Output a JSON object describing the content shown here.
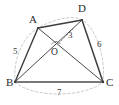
{
  "figure": {
    "width": 119,
    "height": 105,
    "stroke_color": "#404040",
    "dash_color": "#b0b0b0",
    "base_color": "#707070"
  },
  "vertices": [
    {
      "id": "A",
      "label": "A",
      "x": 38,
      "y": 28,
      "label_x": 29,
      "label_y": 14
    },
    {
      "id": "D",
      "label": "D",
      "x": 82,
      "y": 20,
      "label_x": 78,
      "label_y": 3
    },
    {
      "id": "B",
      "label": "B",
      "x": 15,
      "y": 82,
      "label_x": 6,
      "label_y": 77
    },
    {
      "id": "C",
      "label": "C",
      "x": 103,
      "y": 82,
      "label_x": 106,
      "label_y": 77
    },
    {
      "id": "O",
      "label": "O",
      "x": 56,
      "y": 47,
      "label_x": 51,
      "label_y": 48
    }
  ],
  "measures": [
    {
      "id": "AB",
      "label": "5",
      "label_x": 13,
      "label_y": 47
    },
    {
      "id": "DC",
      "label": "6",
      "label_x": 97,
      "label_y": 40
    },
    {
      "id": "OD",
      "label": "3",
      "label_x": 68,
      "label_y": 31
    },
    {
      "id": "BC",
      "label": "7",
      "label_x": 57,
      "label_y": 88
    }
  ],
  "markers": [
    {
      "id": "right-angle-at-O",
      "type": "right-angle",
      "x": 56,
      "y": 47
    }
  ],
  "edges": [
    {
      "id": "A-D",
      "from": "A",
      "to": "D",
      "style": "solid"
    },
    {
      "id": "A-B",
      "from": "A",
      "to": "B",
      "style": "solid"
    },
    {
      "id": "D-C",
      "from": "D",
      "to": "C",
      "style": "solid"
    },
    {
      "id": "B-C",
      "from": "B",
      "to": "C",
      "style": "solid-thick"
    },
    {
      "id": "A-C",
      "from": "A",
      "to": "C",
      "style": "solid"
    },
    {
      "id": "B-D",
      "from": "B",
      "to": "D",
      "style": "solid"
    },
    {
      "id": "A-O-tick",
      "from": "A",
      "to": "O",
      "style": "solid"
    },
    {
      "id": "O-D-dashed",
      "from": "O",
      "to": "D",
      "style": "dashed"
    }
  ],
  "arcs": [
    {
      "id": "circumscribed-arc",
      "style": "dashed",
      "color": "#bdbdbd"
    }
  ]
}
